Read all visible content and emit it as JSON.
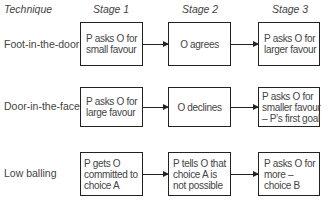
{
  "headers": {
    "technique": "Technique",
    "stage1": "Stage 1",
    "stage2": "Stage 2",
    "stage3": "Stage 3"
  },
  "rows": [
    {
      "technique": "Foot-in-the-door",
      "stage1": [
        "P asks O for",
        "small favour"
      ],
      "stage2": [
        "O agrees"
      ],
      "stage3": [
        "P asks O for",
        "larger favour"
      ]
    },
    {
      "technique": "Door-in-the-face",
      "stage1": [
        "P asks O for",
        "large favour"
      ],
      "stage2": [
        "O declines"
      ],
      "stage3": [
        "P asks O for",
        "smaller favour",
        "– P’s first goal"
      ]
    },
    {
      "technique": "Low balling",
      "stage1": [
        "P gets O",
        "committed to",
        "choice A"
      ],
      "stage2": [
        "P tells O that",
        "choice A is",
        "not possible"
      ],
      "stage3": [
        "P asks O for",
        "more –",
        "choice B"
      ]
    }
  ]
}
